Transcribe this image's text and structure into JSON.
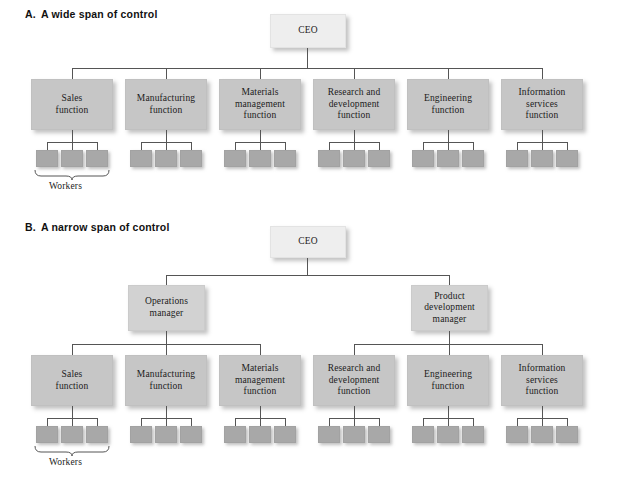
{
  "figure": {
    "sections": [
      {
        "id": "wide",
        "letter": "A.",
        "title": "A wide span of control",
        "top_node": {
          "label": "CEO",
          "type": "executive"
        },
        "middle_managers": [],
        "functions": [
          {
            "label": "Sales\nfunction",
            "line1": "Sales",
            "line2": "function",
            "line3": ""
          },
          {
            "label": "Manufacturing\nfunction",
            "line1": "Manufacturing",
            "line2": "function",
            "line3": ""
          },
          {
            "label": "Materials\nmanagement\nfunction",
            "line1": "Materials",
            "line2": "management",
            "line3": "function"
          },
          {
            "label": "Research and\ndevelopment\nfunction",
            "line1": "Research and",
            "line2": "development",
            "line3": "function"
          },
          {
            "label": "Engineering\nfunction",
            "line1": "Engineering",
            "line2": "function",
            "line3": ""
          },
          {
            "label": "Information\nservices\nfunction",
            "line1": "Information",
            "line2": "services",
            "line3": "function"
          }
        ],
        "workers_per_function": 3,
        "workers_label": "Workers"
      },
      {
        "id": "narrow",
        "letter": "B.",
        "title": "A narrow span of control",
        "top_node": {
          "label": "CEO",
          "type": "executive"
        },
        "middle_managers": [
          {
            "line1": "Operations",
            "line2": "manager",
            "line3": ""
          },
          {
            "line1": "Product",
            "line2": "development",
            "line3": "manager"
          }
        ],
        "functions": [
          {
            "line1": "Sales",
            "line2": "function",
            "line3": ""
          },
          {
            "line1": "Manufacturing",
            "line2": "function",
            "line3": ""
          },
          {
            "line1": "Materials",
            "line2": "management",
            "line3": "function"
          },
          {
            "line1": "Research and",
            "line2": "development",
            "line3": "function"
          },
          {
            "line1": "Engineering",
            "line2": "function",
            "line3": ""
          },
          {
            "line1": "Information",
            "line2": "services",
            "line3": "function"
          }
        ],
        "workers_per_function": 3,
        "workers_label": "Workers"
      }
    ],
    "colors": {
      "executive_box": "#eeeeee",
      "manager_box": "#d2d2d2",
      "function_box": "#c6c6c6",
      "worker_box": "#a8a8a8",
      "line": "#555555",
      "background": "#ffffff",
      "text": "#1b1b1b"
    }
  }
}
